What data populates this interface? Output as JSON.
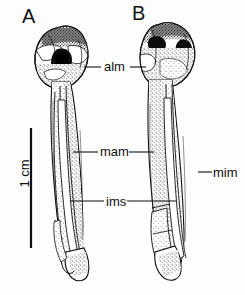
{
  "figure": {
    "type": "scientific-line-drawing",
    "background_color": "#fdfdfd",
    "ink_color": "#111111"
  },
  "panels": [
    {
      "id": "A",
      "letter": "A",
      "aspect": "left specimen"
    },
    {
      "id": "B",
      "letter": "B",
      "aspect": "right specimen"
    }
  ],
  "annotations": [
    {
      "id": "alm",
      "label": "alm",
      "points_to": [
        "A",
        "B"
      ]
    },
    {
      "id": "mam",
      "label": "mam",
      "points_to": [
        "A",
        "B"
      ]
    },
    {
      "id": "ims",
      "label": "ims",
      "points_to": [
        "A",
        "B"
      ]
    },
    {
      "id": "mim",
      "label": "mim",
      "points_to": [
        "B"
      ]
    }
  ],
  "scale_bar": {
    "label": "1 cm",
    "orientation": "vertical",
    "length_px": 120
  }
}
